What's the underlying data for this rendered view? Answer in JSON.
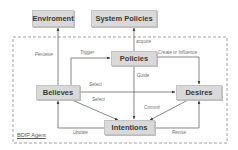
{
  "diagram": {
    "type": "flowchart",
    "frame": {
      "label": "BDIP Agent",
      "style": "dashed"
    },
    "nodes": {
      "environment": {
        "label": "Enviroment"
      },
      "system_policies": {
        "label": "System Policies"
      },
      "policies": {
        "label": "Policies"
      },
      "believes": {
        "label": "Believes"
      },
      "desires": {
        "label": "Desires"
      },
      "intentions": {
        "label": "Intentions"
      }
    },
    "edges": {
      "perceive": {
        "label": "Perceive",
        "from": "Believes",
        "to": "Enviroment"
      },
      "trigger": {
        "label": "Trigger",
        "from": "Believes",
        "to": "Policies"
      },
      "acquire": {
        "label": "acquire",
        "from": "Policies",
        "to": "System Policies"
      },
      "create_or_influence": {
        "label": "Create or Influence",
        "from": "Policies",
        "to": "Desires"
      },
      "guide": {
        "label": "Guide",
        "from": "Policies",
        "to": "Intentions"
      },
      "select_desires": {
        "label": "Select",
        "from": "Believes",
        "to": "Desires"
      },
      "select_intentions": {
        "label": "Select",
        "from": "Believes",
        "to": "Intentions"
      },
      "commit": {
        "label": "Commit",
        "from": "Desires",
        "to": "Intentions"
      },
      "update": {
        "label": "Update",
        "from": "Intentions",
        "to": "Believes"
      },
      "revise": {
        "label": "Revise",
        "from": "Intentions",
        "to": "Desires"
      }
    },
    "colors": {
      "node_fill": "#d9d9d9",
      "node_border": "#c4c4c4",
      "line": "#555555",
      "text": "#3a3a3a"
    }
  }
}
